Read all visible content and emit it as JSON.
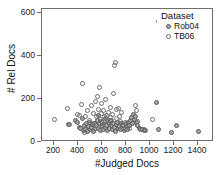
{
  "chart_data": {
    "type": "scatter",
    "title": "",
    "xlabel": "#Judged Docs",
    "ylabel": "# Rel Docs",
    "xlim": [
      100,
      1500
    ],
    "ylim": [
      -30,
      640
    ],
    "xticks": [
      200,
      400,
      600,
      800,
      1000,
      1200,
      1400
    ],
    "yticks": [
      0,
      200,
      400,
      600
    ],
    "grid": false,
    "legend": {
      "title": "Dataset",
      "position": "top-right",
      "entries": [
        {
          "name": "Rob04",
          "marker": "filled-circle",
          "color": "#a6a6a6",
          "edge": "#595959"
        },
        {
          "name": "TB06",
          "marker": "open-circle",
          "color": "#ffffff",
          "edge": "#6b6b6b"
        }
      ]
    },
    "series": [
      {
        "name": "Rob04",
        "marker": "filled-circle",
        "points": [
          [
            318,
            48
          ],
          [
            372,
            72
          ],
          [
            396,
            62
          ],
          [
            406,
            36
          ],
          [
            420,
            30
          ],
          [
            434,
            78
          ],
          [
            440,
            20
          ],
          [
            452,
            44
          ],
          [
            462,
            26
          ],
          [
            470,
            52
          ],
          [
            478,
            14
          ],
          [
            486,
            40
          ],
          [
            492,
            60
          ],
          [
            500,
            22
          ],
          [
            508,
            34
          ],
          [
            516,
            48
          ],
          [
            524,
            16
          ],
          [
            532,
            56
          ],
          [
            540,
            28
          ],
          [
            548,
            42
          ],
          [
            556,
            70
          ],
          [
            562,
            96
          ],
          [
            568,
            30
          ],
          [
            574,
            52
          ],
          [
            580,
            18
          ],
          [
            588,
            64
          ],
          [
            596,
            38
          ],
          [
            604,
            24
          ],
          [
            612,
            50
          ],
          [
            620,
            82
          ],
          [
            626,
            34
          ],
          [
            634,
            46
          ],
          [
            642,
            20
          ],
          [
            650,
            58
          ],
          [
            658,
            30
          ],
          [
            664,
            68
          ],
          [
            672,
            42
          ],
          [
            680,
            26
          ],
          [
            688,
            54
          ],
          [
            696,
            36
          ],
          [
            704,
            16
          ],
          [
            712,
            48
          ],
          [
            720,
            62
          ],
          [
            728,
            28
          ],
          [
            736,
            40
          ],
          [
            744,
            22
          ],
          [
            752,
            56
          ],
          [
            760,
            34
          ],
          [
            768,
            44
          ],
          [
            776,
            18
          ],
          [
            784,
            30
          ],
          [
            792,
            52
          ],
          [
            800,
            38
          ],
          [
            808,
            24
          ],
          [
            816,
            60
          ],
          [
            824,
            42
          ],
          [
            832,
            70
          ],
          [
            840,
            86
          ],
          [
            848,
            56
          ],
          [
            856,
            100
          ],
          [
            864,
            74
          ],
          [
            872,
            90
          ],
          [
            880,
            62
          ],
          [
            888,
            44
          ],
          [
            900,
            30
          ],
          [
            912,
            22
          ],
          [
            926,
            26
          ],
          [
            940,
            18
          ],
          [
            1046,
            160
          ],
          [
            1056,
            22
          ],
          [
            1164,
            10
          ],
          [
            1204,
            42
          ],
          [
            1392,
            16
          ]
        ]
      },
      {
        "name": "TB06",
        "marker": "open-circle",
        "points": [
          [
            204,
            74
          ],
          [
            310,
            130
          ],
          [
            326,
            48
          ],
          [
            396,
            102
          ],
          [
            412,
            96
          ],
          [
            424,
            152
          ],
          [
            436,
            258
          ],
          [
            448,
            10
          ],
          [
            462,
            88
          ],
          [
            476,
            122
          ],
          [
            492,
            70
          ],
          [
            506,
            146
          ],
          [
            518,
            56
          ],
          [
            528,
            108
          ],
          [
            540,
            166
          ],
          [
            548,
            90
          ],
          [
            556,
            190
          ],
          [
            562,
            128
          ],
          [
            570,
            236
          ],
          [
            578,
            74
          ],
          [
            586,
            158
          ],
          [
            594,
            104
          ],
          [
            600,
            62
          ],
          [
            608,
            120
          ],
          [
            616,
            88
          ],
          [
            624,
            176
          ],
          [
            632,
            96
          ],
          [
            640,
            70
          ],
          [
            648,
            112
          ],
          [
            654,
            56
          ],
          [
            662,
            138
          ],
          [
            668,
            84
          ],
          [
            676,
            68
          ],
          [
            684,
            102
          ],
          [
            692,
            210
          ],
          [
            700,
            350
          ],
          [
            706,
            366
          ],
          [
            712,
            124
          ],
          [
            716,
            78
          ],
          [
            722,
            60
          ],
          [
            728,
            132
          ],
          [
            736,
            90
          ],
          [
            744,
            66
          ],
          [
            752,
            112
          ],
          [
            760,
            44
          ],
          [
            784,
            58
          ],
          [
            820,
            30
          ],
          [
            866,
            148
          ],
          [
            876,
            120
          ],
          [
            886,
            66
          ],
          [
            944,
            24
          ],
          [
            954,
            20
          ],
          [
            1014,
            76
          ],
          [
            1056,
            574
          ]
        ]
      }
    ]
  }
}
